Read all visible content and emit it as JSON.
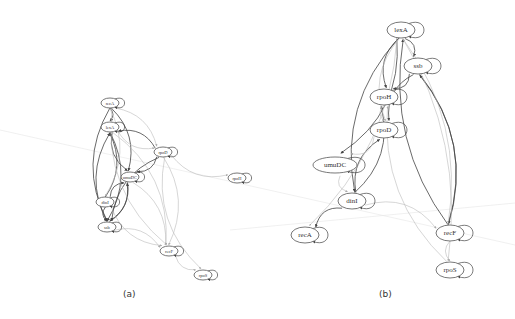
{
  "figure": {
    "panels": [
      {
        "id": "a",
        "caption": "(a)",
        "caption_pos": [
          127,
          295
        ],
        "font_size": 4.5,
        "node_rx": 9,
        "node_ry": 5,
        "nodes": [
          {
            "id": "recA",
            "label": "recA",
            "x": 110,
            "y": 103
          },
          {
            "id": "lexA",
            "label": "lexA",
            "x": 110,
            "y": 127
          },
          {
            "id": "rpoD",
            "label": "rpoD",
            "x": 163,
            "y": 152
          },
          {
            "id": "umuDC",
            "label": "umuDC",
            "x": 130,
            "y": 177
          },
          {
            "id": "rpoH",
            "label": "rpoH",
            "x": 237,
            "y": 178
          },
          {
            "id": "dinI",
            "label": "dinI",
            "x": 105,
            "y": 202
          },
          {
            "id": "ssb",
            "label": "ssb",
            "x": 107,
            "y": 227
          },
          {
            "id": "recF",
            "label": "recF",
            "x": 169,
            "y": 251
          },
          {
            "id": "rpoS",
            "label": "rpoS",
            "x": 203,
            "y": 275
          }
        ],
        "edges": [
          {
            "from": "recA",
            "to": "lexA",
            "strength": "dark"
          },
          {
            "from": "recA",
            "to": "ssb",
            "strength": "dark"
          },
          {
            "from": "recA",
            "to": "umuDC",
            "strength": "dark"
          },
          {
            "from": "lexA",
            "to": "umuDC",
            "strength": "dark"
          },
          {
            "from": "lexA",
            "to": "ssb",
            "strength": "dark"
          },
          {
            "from": "dinI",
            "to": "lexA",
            "strength": "dark"
          },
          {
            "from": "ssb",
            "to": "lexA",
            "strength": "dark"
          },
          {
            "from": "rpoD",
            "to": "lexA",
            "strength": "dark"
          },
          {
            "from": "rpoD",
            "to": "umuDC",
            "strength": "dark"
          },
          {
            "from": "rpoD",
            "to": "ssb",
            "strength": "dark"
          },
          {
            "from": "umuDC",
            "to": "ssb",
            "strength": "dark"
          },
          {
            "from": "ssb",
            "to": "umuDC",
            "strength": "dark"
          },
          {
            "from": "dinI",
            "to": "umuDC",
            "strength": "dark"
          },
          {
            "from": "dinI",
            "to": "ssb",
            "strength": "dark"
          },
          {
            "from": "recA",
            "to": "rpoD",
            "strength": "light"
          },
          {
            "from": "recA",
            "to": "recF",
            "strength": "light"
          },
          {
            "from": "lexA",
            "to": "recF",
            "strength": "light"
          },
          {
            "from": "rpoD",
            "to": "rpoH",
            "strength": "light"
          },
          {
            "from": "rpoD",
            "to": "recF",
            "strength": "light"
          },
          {
            "from": "rpoD",
            "to": "rpoS",
            "strength": "light"
          },
          {
            "from": "umuDC",
            "to": "recF",
            "strength": "light"
          },
          {
            "from": "dinI",
            "to": "recF",
            "strength": "light"
          },
          {
            "from": "ssb",
            "to": "recF",
            "strength": "light"
          },
          {
            "from": "recF",
            "to": "rpoS",
            "strength": "light"
          },
          {
            "from": "recA",
            "to": "dinI",
            "strength": "light"
          },
          {
            "from": "lexA",
            "to": "rpoD",
            "strength": "light"
          }
        ],
        "self_loops": [
          "recA",
          "lexA",
          "rpoD",
          "umuDC",
          "rpoH",
          "dinI",
          "ssb",
          "recF",
          "rpoS"
        ]
      },
      {
        "id": "b",
        "caption": "(b)",
        "caption_pos": [
          383,
          295
        ],
        "font_size": 7,
        "node_rx": 14,
        "node_ry": 8,
        "nodes": [
          {
            "id": "lexA",
            "label": "lexA",
            "x": 401,
            "y": 30
          },
          {
            "id": "ssb",
            "label": "ssb",
            "x": 418,
            "y": 66
          },
          {
            "id": "rpoH",
            "label": "rpoH",
            "x": 384,
            "y": 97
          },
          {
            "id": "rpoD",
            "label": "rpoD",
            "x": 384,
            "y": 130
          },
          {
            "id": "umuDC",
            "label": "umuDC",
            "x": 335,
            "y": 165,
            "rx": 22
          },
          {
            "id": "dinI",
            "label": "dinI",
            "x": 352,
            "y": 201
          },
          {
            "id": "recA",
            "label": "recA",
            "x": 305,
            "y": 235
          },
          {
            "id": "recF",
            "label": "recF",
            "x": 450,
            "y": 233
          },
          {
            "id": "rpoS",
            "label": "rpoS",
            "x": 450,
            "y": 270
          }
        ],
        "edges": [
          {
            "from": "lexA",
            "to": "ssb",
            "strength": "dark"
          },
          {
            "from": "lexA",
            "to": "rpoH",
            "strength": "dark"
          },
          {
            "from": "lexA",
            "to": "umuDC",
            "strength": "dark"
          },
          {
            "from": "lexA",
            "to": "dinI",
            "strength": "dark"
          },
          {
            "from": "ssb",
            "to": "rpoH",
            "strength": "dark"
          },
          {
            "from": "ssb",
            "to": "rpoD",
            "strength": "dark"
          },
          {
            "from": "ssb",
            "to": "recF",
            "strength": "dark"
          },
          {
            "from": "recF",
            "to": "ssb",
            "strength": "dark"
          },
          {
            "from": "recF",
            "to": "lexA",
            "strength": "dark"
          },
          {
            "from": "dinI",
            "to": "rpoH",
            "strength": "dark"
          },
          {
            "from": "dinI",
            "to": "rpoD",
            "strength": "dark"
          },
          {
            "from": "dinI",
            "to": "recA",
            "strength": "dark"
          },
          {
            "from": "lexA",
            "to": "recA",
            "strength": "light"
          },
          {
            "from": "lexA",
            "to": "rpoD",
            "strength": "light"
          },
          {
            "from": "lexA",
            "to": "rpoS",
            "strength": "light"
          },
          {
            "from": "rpoH",
            "to": "rpoD",
            "strength": "light"
          },
          {
            "from": "rpoD",
            "to": "umuDC",
            "strength": "light"
          },
          {
            "from": "umuDC",
            "to": "dinI",
            "strength": "light"
          },
          {
            "from": "dinI",
            "to": "recF",
            "strength": "light"
          },
          {
            "from": "recF",
            "to": "rpoS",
            "strength": "light"
          },
          {
            "from": "rpoS",
            "to": "rpoH",
            "strength": "light"
          },
          {
            "from": "recF",
            "to": "lexA",
            "strength": "light"
          }
        ],
        "self_loops": [
          "lexA",
          "ssb",
          "rpoH",
          "rpoD",
          "umuDC",
          "dinI",
          "recA",
          "recF",
          "rpoS"
        ]
      }
    ],
    "background_lines": [
      {
        "x1": 0,
        "y1": 130,
        "x2": 515,
        "y2": 245
      },
      {
        "x1": 230,
        "y1": 230,
        "x2": 515,
        "y2": 203
      }
    ],
    "colors": {
      "dark_edge": "#444444",
      "light_edge": "#bbbbbb",
      "node_stroke": "#555555",
      "background_line": "#e6e6e6"
    }
  }
}
